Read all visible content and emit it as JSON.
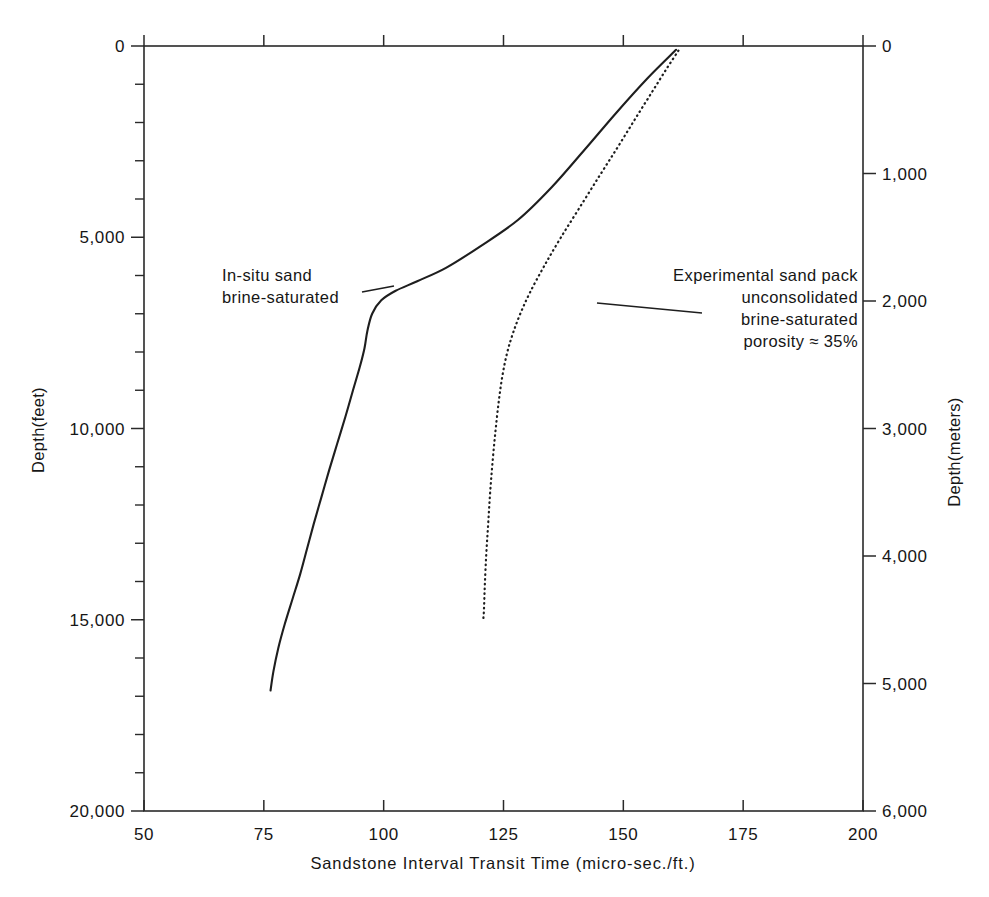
{
  "figure": {
    "title": "",
    "background_color": "#ffffff",
    "ink_color": "#1e1e1e"
  },
  "axes": {
    "x": {
      "title": "Sandstone Interval Transit Time (micro-sec./ft.)",
      "ticks": [
        "50",
        "75",
        "100",
        "125",
        "150",
        "175",
        "200"
      ],
      "range": [
        50,
        200
      ]
    },
    "y_left": {
      "title": "Depth(feet)",
      "ticks": [
        "0",
        "5,000",
        "10,000",
        "15,000",
        "20,000"
      ],
      "range": [
        0,
        20000
      ]
    },
    "y_right": {
      "title": "Depth(meters)",
      "ticks": [
        "0",
        "1,000",
        "2,000",
        "3,000",
        "4,000",
        "5,000",
        "6,000"
      ],
      "range": [
        0,
        6000
      ]
    }
  },
  "annotations": {
    "left": {
      "line1": "In-situ sand",
      "line2": "brine-saturated"
    },
    "right": {
      "line1": "Experimental sand pack",
      "line2": "unconsolidated",
      "line3": "brine-saturated",
      "line4": "porosity ≈ 35%"
    }
  },
  "chart_data": {
    "type": "line",
    "title": "",
    "xlabel": "Sandstone Interval Transit Time (micro-sec./ft.)",
    "ylabel": "Depth(feet)",
    "ylabel_secondary": "Depth(meters)",
    "xlim": [
      50,
      200
    ],
    "ylim": [
      0,
      20000
    ],
    "ylim_secondary": [
      0,
      6000
    ],
    "y_inverted": true,
    "grid": false,
    "legend": "annotations-with-leader-lines",
    "xticks": [
      50,
      75,
      100,
      125,
      150,
      175,
      200
    ],
    "yticks_left": [
      0,
      5000,
      10000,
      15000,
      20000
    ],
    "yticks_left_minor_step": 1000,
    "yticks_right": [
      0,
      1000,
      2000,
      3000,
      4000,
      5000,
      6000
    ],
    "series": [
      {
        "name": "In-situ sand brine-saturated",
        "style": "solid",
        "points": [
          [
            161.0,
            100
          ],
          [
            155.0,
            850
          ],
          [
            148.5,
            1750
          ],
          [
            142.0,
            2700
          ],
          [
            135.0,
            3700
          ],
          [
            128.0,
            4550
          ],
          [
            120.0,
            5250
          ],
          [
            113.0,
            5800
          ],
          [
            107.0,
            6150
          ],
          [
            102.5,
            6400
          ],
          [
            99.5,
            6650
          ],
          [
            97.6,
            7000
          ],
          [
            96.6,
            7450
          ],
          [
            96.0,
            7900
          ],
          [
            95.0,
            8400
          ],
          [
            93.6,
            9000
          ],
          [
            92.0,
            9700
          ],
          [
            90.3,
            10400
          ],
          [
            88.6,
            11100
          ],
          [
            87.0,
            11800
          ],
          [
            85.4,
            12500
          ],
          [
            84.0,
            13150
          ],
          [
            82.6,
            13800
          ],
          [
            81.0,
            14450
          ],
          [
            79.4,
            15100
          ],
          [
            78.0,
            15750
          ],
          [
            77.0,
            16350
          ],
          [
            76.4,
            16850
          ]
        ]
      },
      {
        "name": "Experimental sand pack unconsolidated brine-saturated porosity ≈ 35%",
        "style": "dotted",
        "points": [
          [
            161.5,
            120
          ],
          [
            159.0,
            600
          ],
          [
            156.0,
            1200
          ],
          [
            152.5,
            1900
          ],
          [
            148.8,
            2650
          ],
          [
            145.0,
            3400
          ],
          [
            141.0,
            4200
          ],
          [
            137.0,
            5000
          ],
          [
            133.5,
            5750
          ],
          [
            130.5,
            6450
          ],
          [
            128.5,
            7000
          ],
          [
            127.0,
            7500
          ],
          [
            125.8,
            8000
          ],
          [
            124.8,
            8600
          ],
          [
            124.0,
            9300
          ],
          [
            123.3,
            10100
          ],
          [
            122.7,
            10900
          ],
          [
            122.2,
            11700
          ],
          [
            121.8,
            12500
          ],
          [
            121.4,
            13300
          ],
          [
            121.1,
            14100
          ],
          [
            120.9,
            14800
          ],
          [
            120.7,
            15050
          ]
        ]
      }
    ]
  }
}
